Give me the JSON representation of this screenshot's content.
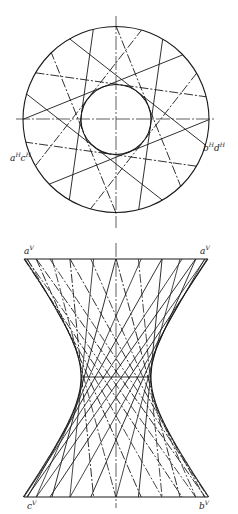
{
  "figure": {
    "colors": {
      "ink": "#1a1a1a",
      "background": "#ffffff"
    },
    "plan_view": {
      "center": [
        116,
        119.5
      ],
      "outer_radius": 93,
      "throat_radius": 35,
      "generator_count": 12,
      "start_angle_deg": 8,
      "centerline_h": {
        "x1": 16,
        "x2": 214,
        "y": 119
      },
      "centerline_v": {
        "x": 116,
        "y1": 16,
        "y2": 228
      },
      "labels": {
        "left": {
          "text": "a",
          "sup1": "H",
          "text2": "c",
          "sup2": "H",
          "x": 10,
          "y": 161
        },
        "right": {
          "text": "b",
          "sup1": "H",
          "text2": "d",
          "sup2": "H",
          "x": 203,
          "y": 151
        }
      }
    },
    "front_view": {
      "center_x": 116,
      "top_y": 259,
      "waist_y": 377,
      "bottom_y": 497,
      "outer_half_width": 92,
      "throat_half_width": 35,
      "centerline_v": {
        "x": 116,
        "y1": 243,
        "y2": 508
      },
      "labels": {
        "top_left": {
          "text": "a",
          "sup": "V",
          "x": 24,
          "y": 254
        },
        "top_right": {
          "text": "a",
          "sup": "V",
          "x": 200,
          "y": 254
        },
        "bottom_left": {
          "text": "c",
          "sup": "V",
          "x": 27,
          "y": 509
        },
        "bottom_right": {
          "text": "b",
          "sup": "V",
          "x": 199,
          "y": 509
        }
      }
    }
  }
}
